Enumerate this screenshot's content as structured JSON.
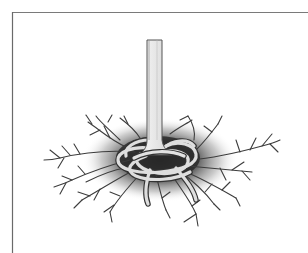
{
  "illustration": {
    "subject": "Tree trunk with girdling roots circling around the base",
    "style": "grayscale line drawing",
    "elements": [
      "frame",
      "trunk",
      "soil-shadow",
      "circling-roots",
      "lateral-roots"
    ],
    "colors": {
      "background": "#ffffff",
      "frame_line": "#6e6e6e",
      "trunk_fill": "#e4e4e4",
      "trunk_outline": "#555555",
      "root_outline": "#3a3a3a",
      "root_fill": "#dcdcdc",
      "shadow_dark": "#1e1e1e"
    }
  }
}
